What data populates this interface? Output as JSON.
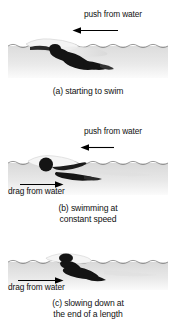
{
  "figure": {
    "background_color": "#ffffff",
    "water_color": "#e8e8e8",
    "swimmer_color": "#1a1a1a",
    "arrow_color": "#000000"
  },
  "panels": [
    {
      "id": "a",
      "caption_line1": "(a) starting to swim",
      "caption_line2": "",
      "labels": [
        {
          "name": "push-from-water",
          "text": "push from water",
          "arrow_direction": "left"
        }
      ]
    },
    {
      "id": "b",
      "caption_line1": "(b) swimming at",
      "caption_line2": "constant speed",
      "labels": [
        {
          "name": "push-from-water",
          "text": "push from water",
          "arrow_direction": "left"
        },
        {
          "name": "drag-from-water",
          "text": "drag from water",
          "arrow_direction": "right"
        }
      ]
    },
    {
      "id": "c",
      "caption_line1": "(c) slowing down at",
      "caption_line2": "the end of a length",
      "labels": [
        {
          "name": "drag-from-water",
          "text": "drag from water",
          "arrow_direction": "right"
        }
      ]
    }
  ]
}
